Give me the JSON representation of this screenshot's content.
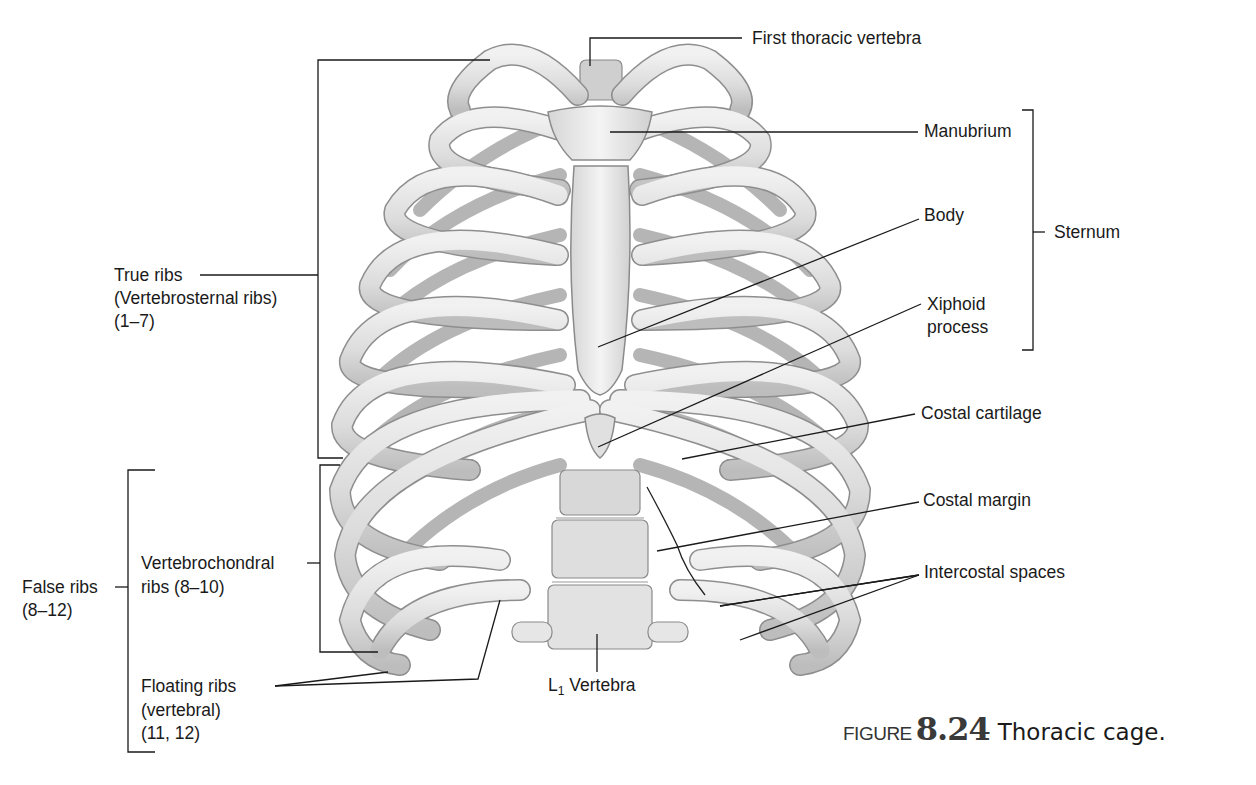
{
  "figure": {
    "caption": {
      "prefix": "FIGURE",
      "number": "8.24",
      "title": "Thoracic cage."
    },
    "illustration": {
      "subject": "thoracic-cage-anterior-view",
      "colors": {
        "bone": "#e4e4e4",
        "bone_shade": "#b8b8b8",
        "outline": "#8a8a8a",
        "line": "#1a1a1a"
      }
    },
    "labels": {
      "first_thoracic_vertebra": "First thoracic vertebra",
      "manubrium": "Manubrium",
      "body": "Body",
      "sternum": "Sternum",
      "xiphoid_line1": "Xiphoid",
      "xiphoid_line2": "process",
      "costal_cartilage": "Costal cartilage",
      "costal_margin": "Costal margin",
      "intercostal_spaces": "Intercostal spaces",
      "l1_prefix": "L",
      "l1_sub": "1",
      "l1_suffix": " Vertebra",
      "true_ribs_line1": "True ribs",
      "true_ribs_line2": "(Vertebrosternal ribs)",
      "true_ribs_line3": "(1–7)",
      "false_ribs_line1": "False ribs",
      "false_ribs_line2": "(8–12)",
      "vertebrochondral_line1": "Vertebrochondral",
      "vertebrochondral_line2": "ribs (8–10)",
      "floating_line1": "Floating ribs",
      "floating_line2": "(vertebral)",
      "floating_line3": "(11, 12)"
    }
  }
}
